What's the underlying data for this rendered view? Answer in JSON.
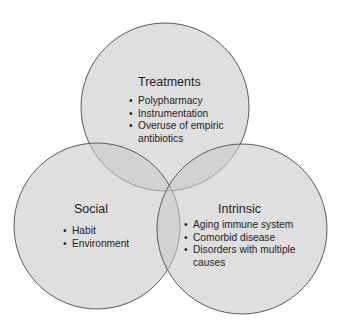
{
  "diagram": {
    "type": "venn-3",
    "colors": {
      "fill": "#c8c8c8",
      "fill_opacity": 0.55,
      "stroke": "#5a5a5a",
      "background": "#ffffff"
    },
    "circles": [
      {
        "id": "treatments",
        "title": "Treatments",
        "items": [
          "Polypharmacy",
          "Instrumentation",
          "Overuse of empiric antibiotics"
        ],
        "item_lines": [
          "Polypharmacy",
          "Instrumentation",
          "Overuse of empiric",
          "antibiotics"
        ]
      },
      {
        "id": "social",
        "title": "Social",
        "items": [
          "Habit",
          "Environment"
        ]
      },
      {
        "id": "intrinsic",
        "title": "Intrinsic",
        "items": [
          "Aging immune system",
          "Comorbid disease",
          "Disorders with multiple causes"
        ],
        "item_lines": [
          "Aging immune system",
          "Comorbid disease",
          "Disorders with multiple",
          "causes"
        ]
      }
    ]
  }
}
